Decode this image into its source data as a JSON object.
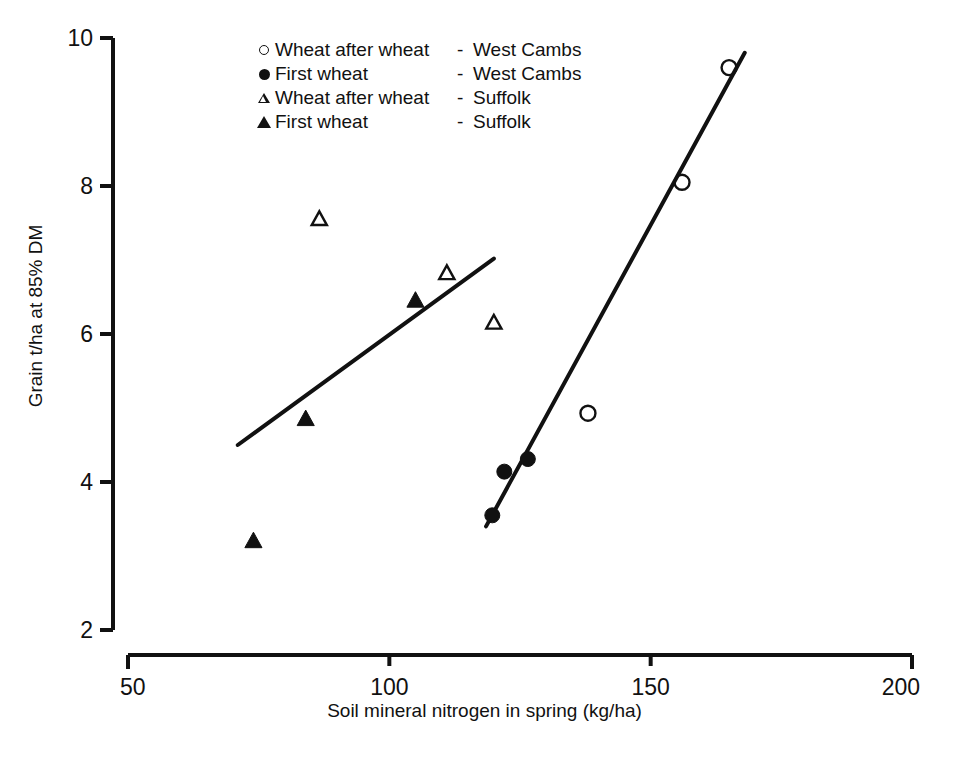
{
  "chart_data": {
    "type": "scatter",
    "title": "",
    "xlabel": "Soil mineral nitrogen in spring (kg/ha)",
    "ylabel": "Grain t/ha at 85% DM",
    "xlim": [
      50,
      200
    ],
    "ylim": [
      2,
      10
    ],
    "xticks": [
      50,
      100,
      150,
      200
    ],
    "yticks": [
      2,
      4,
      6,
      8,
      10
    ],
    "grid": false,
    "legend_position": "top-left-inside",
    "series": [
      {
        "name": "Wheat after wheat - West Cambs",
        "label": "Wheat after wheat",
        "site": "West Cambs",
        "marker": "circle-open",
        "points": [
          {
            "x": 138,
            "y": 4.93
          },
          {
            "x": 156,
            "y": 8.05
          },
          {
            "x": 165,
            "y": 9.6
          }
        ]
      },
      {
        "name": "First wheat - West Cambs",
        "label": "First wheat",
        "site": "West Cambs",
        "marker": "circle-filled",
        "points": [
          {
            "x": 119.7,
            "y": 3.55
          },
          {
            "x": 122,
            "y": 4.14
          },
          {
            "x": 126.5,
            "y": 4.31
          }
        ]
      },
      {
        "name": "Wheat after wheat - Suffolk",
        "label": "Wheat after wheat",
        "site": "Suffolk",
        "marker": "triangle-open",
        "points": [
          {
            "x": 86.6,
            "y": 7.55
          },
          {
            "x": 111,
            "y": 6.82
          },
          {
            "x": 120,
            "y": 6.15
          }
        ]
      },
      {
        "name": "First wheat - Suffolk",
        "label": "First wheat",
        "site": "Suffolk",
        "marker": "triangle-filled",
        "points": [
          {
            "x": 74,
            "y": 3.2
          },
          {
            "x": 84,
            "y": 4.85
          },
          {
            "x": 105,
            "y": 6.45
          }
        ]
      }
    ],
    "fit_lines": [
      {
        "name": "Suffolk regression",
        "x1": 71,
        "y1": 4.5,
        "x2": 120,
        "y2": 7.02
      },
      {
        "name": "West Cambs regression",
        "x1": 118.5,
        "y1": 3.4,
        "x2": 168,
        "y2": 9.8
      }
    ]
  },
  "axes": {
    "x_title": "Soil mineral nitrogen in spring (kg/ha)",
    "y_title": "Grain t/ha at 85% DM",
    "x_tick_labels": [
      "50",
      "100",
      "150",
      "200"
    ],
    "y_tick_labels": [
      "10",
      "8",
      "6",
      "4",
      "2"
    ]
  },
  "legend": {
    "rows": [
      {
        "symbol": "circle-open",
        "label": "Wheat after wheat",
        "dash": "-",
        "site": "West Cambs"
      },
      {
        "symbol": "circle-filled",
        "label": "First wheat",
        "dash": "-",
        "site": "West Cambs"
      },
      {
        "symbol": "triangle-open",
        "label": "Wheat after wheat",
        "dash": "-",
        "site": "Suffolk"
      },
      {
        "symbol": "triangle-filled",
        "label": "First wheat",
        "dash": "-",
        "site": "Suffolk"
      }
    ]
  },
  "colors": {
    "ink": "#111111",
    "background": "#ffffff"
  }
}
